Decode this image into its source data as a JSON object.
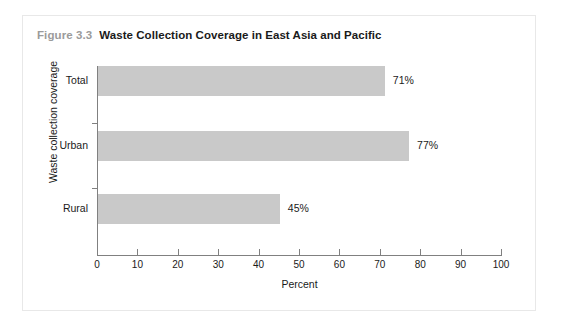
{
  "figure": {
    "number": "Figure 3.3",
    "caption": "Waste Collection Coverage in East Asia and Pacific"
  },
  "colors": {
    "bar_fill": "#c9c9c9",
    "axis": "#808080",
    "text": "#1a1a1a",
    "figure_number": "#9b9b9b",
    "frame": "#e8e8e8",
    "background": "#ffffff"
  },
  "chart_data": {
    "type": "bar",
    "orientation": "horizontal",
    "title": "Waste Collection Coverage in East Asia and Pacific",
    "categories": [
      "Total",
      "Urban",
      "Rural"
    ],
    "values": [
      71,
      77,
      45
    ],
    "value_labels": [
      "71%",
      "77%",
      "45%"
    ],
    "xlabel": "Percent",
    "ylabel": "Waste collection coverage",
    "xlim": [
      0,
      100
    ],
    "xticks": [
      0,
      10,
      20,
      30,
      40,
      50,
      60,
      70,
      80,
      90,
      100
    ],
    "xtick_labels": [
      "0",
      "10",
      "20",
      "30",
      "40",
      "50",
      "60",
      "70",
      "80",
      "90",
      "100"
    ],
    "grid": false,
    "legend": null
  }
}
